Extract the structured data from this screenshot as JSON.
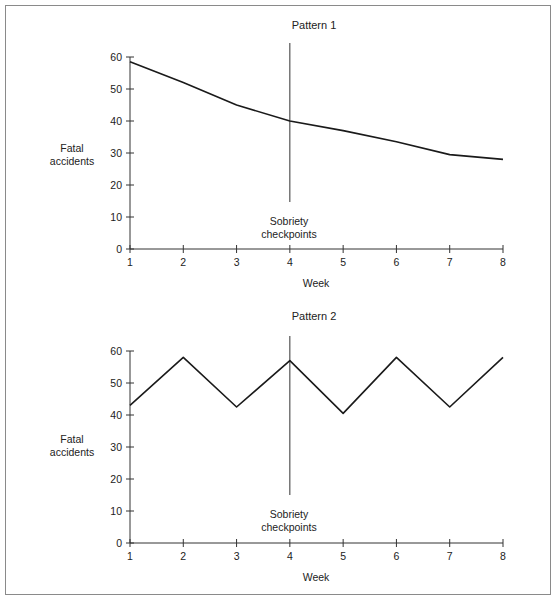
{
  "chart_data": [
    {
      "type": "line",
      "title": "Pattern 1",
      "xlabel": "Week",
      "ylabel": "Fatal accidents",
      "x": [
        1,
        2,
        3,
        4,
        5,
        6,
        7,
        8
      ],
      "values": [
        58.5,
        52,
        45,
        40,
        37,
        33.5,
        29.5,
        28
      ],
      "xlim": [
        1,
        8
      ],
      "ylim": [
        0,
        60
      ],
      "yticks": [
        0,
        10,
        20,
        30,
        40,
        50,
        60
      ],
      "xticks": [
        1,
        2,
        3,
        4,
        5,
        6,
        7,
        8
      ],
      "grid": false,
      "annotations": [
        {
          "type": "vertical-line",
          "x": 4,
          "label": "Sobriety checkpoints"
        }
      ]
    },
    {
      "type": "line",
      "title": "Pattern 2",
      "xlabel": "Week",
      "ylabel": "Fatal accidents",
      "x": [
        1,
        2,
        3,
        4,
        5,
        6,
        7,
        8
      ],
      "values": [
        43,
        58,
        42.5,
        57,
        40.5,
        58,
        42.5,
        58
      ],
      "xlim": [
        1,
        8
      ],
      "ylim": [
        0,
        60
      ],
      "yticks": [
        0,
        10,
        20,
        30,
        40,
        50,
        60
      ],
      "xticks": [
        1,
        2,
        3,
        4,
        5,
        6,
        7,
        8
      ],
      "grid": false,
      "annotations": [
        {
          "type": "vertical-line",
          "x": 4,
          "label": "Sobriety checkpoints"
        }
      ]
    }
  ],
  "charts": [
    {
      "title": "Pattern 1",
      "ylabel_line1": "Fatal",
      "ylabel_line2": "accidents",
      "xlabel": "Week",
      "annotation_line1": "Sobriety",
      "annotation_line2": "checkpoints"
    },
    {
      "title": "Pattern 2",
      "ylabel_line1": "Fatal",
      "ylabel_line2": "accidents",
      "xlabel": "Week",
      "annotation_line1": "Sobriety",
      "annotation_line2": "checkpoints"
    }
  ],
  "colors": {
    "line": "#1a1a1a",
    "axis": "#333333",
    "frame": "#8a8a8a"
  }
}
